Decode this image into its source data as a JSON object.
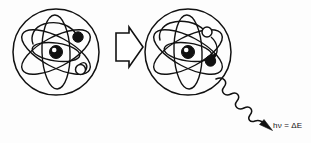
{
  "figure": {
    "background_color": "#fdfdfd",
    "ink_color": "#111111",
    "width": 311,
    "height": 143
  },
  "left_atom": {
    "label": "excited-state atom",
    "center": {
      "x": 56,
      "y": 52
    },
    "radius": 43,
    "nucleus": {
      "x": 56,
      "y": 52,
      "radius": 6
    },
    "orbit_count": 3,
    "electron": {
      "state": "outer-shell",
      "fill": "#111111",
      "x": 78,
      "y": 37,
      "radius": 5
    },
    "vacancy_marker": {
      "state": "open",
      "fill": "#ffffff",
      "x": 80,
      "y": 69,
      "radius": 5
    }
  },
  "transition_arrow": {
    "label": "process-arrow",
    "direction": "right",
    "fill": "#ffffff",
    "stroke": "#111111"
  },
  "right_atom": {
    "label": "ground-state atom after emission",
    "center": {
      "x": 188,
      "y": 52
    },
    "radius": 43,
    "nucleus": {
      "x": 188,
      "y": 52,
      "radius": 6
    },
    "orbit_count": 3,
    "electron": {
      "state": "inner-shell",
      "fill": "#111111",
      "x": 211,
      "y": 61,
      "radius": 5
    },
    "vacancy_marker": {
      "state": "open",
      "fill": "#ffffff",
      "x": 207,
      "y": 32,
      "radius": 5
    },
    "transition_note": "electron drops from outer to inner shell"
  },
  "photon": {
    "label": "emitted-photon",
    "wave_start": {
      "x": 216,
      "y": 79
    },
    "arrow_tip": {
      "x": 272,
      "y": 130
    },
    "caption_html_parts": {
      "h": "h",
      "nu": "ν",
      "equals": " = ",
      "delta_e": "ΔE"
    },
    "caption_text": "hν = ΔE"
  }
}
